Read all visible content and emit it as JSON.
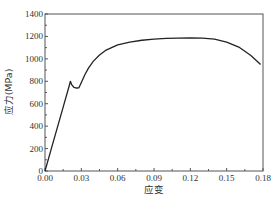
{
  "chart_data": {
    "type": "line",
    "title": "",
    "xlabel": "应变",
    "ylabel": "应力(MPa)",
    "xlim": [
      0,
      0.18
    ],
    "ylim": [
      0,
      1400
    ],
    "xticks": [
      "0.00",
      "0.03",
      "0.06",
      "0.09",
      "0.12",
      "0.15",
      "0.18"
    ],
    "yticks": [
      "0",
      "200",
      "400",
      "600",
      "800",
      "1000",
      "1200",
      "1400"
    ],
    "grid": false,
    "legend": null,
    "series": [
      {
        "name": "stress-strain",
        "color": "#222222",
        "x": [
          0.0,
          0.005,
          0.01,
          0.015,
          0.02,
          0.021,
          0.022,
          0.024,
          0.026,
          0.028,
          0.03,
          0.033,
          0.036,
          0.04,
          0.045,
          0.05,
          0.06,
          0.07,
          0.08,
          0.09,
          0.1,
          0.11,
          0.12,
          0.13,
          0.14,
          0.15,
          0.16,
          0.17,
          0.178
        ],
        "y": [
          0,
          190,
          380,
          570,
          760,
          800,
          770,
          745,
          740,
          742,
          790,
          860,
          920,
          980,
          1035,
          1075,
          1125,
          1150,
          1166,
          1176,
          1182,
          1185,
          1186,
          1184,
          1176,
          1150,
          1105,
          1030,
          950
        ]
      }
    ]
  },
  "axes": {
    "x_label": "应变",
    "y_label": "应力(MPa)",
    "x_ticks": [
      "0.00",
      "0.03",
      "0.06",
      "0.09",
      "0.12",
      "0.15",
      "0.18"
    ],
    "y_ticks": [
      "0",
      "200",
      "400",
      "600",
      "800",
      "1000",
      "1200",
      "1400"
    ]
  }
}
